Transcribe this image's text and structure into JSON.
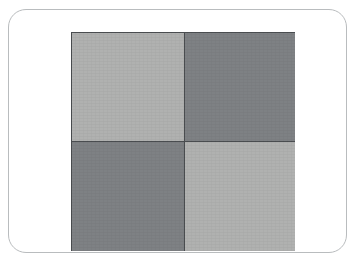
{
  "figure": {
    "title": "",
    "type": "checkerboard-swatch",
    "frame": {
      "name": "rounded-card-frame",
      "background_color": "#ffffff",
      "border_color": "#b9bcbe",
      "border_radius_px": 18,
      "x": 8,
      "y": 9,
      "width": 339,
      "height": 244
    },
    "board": {
      "x": 62,
      "y": 22,
      "width": 224,
      "height": 219,
      "rows": 2,
      "columns": 2,
      "divider_color": "#4a4d50",
      "divider_width_px": 1,
      "outline_color": "#4a4d50"
    },
    "palette": {
      "light_gray": "#b0b1b0",
      "dark_gray": "#7e8184",
      "divider": "#4a4d50",
      "frame_border": "#b9bcbe",
      "page_background": "#ffffff"
    },
    "quadrants": [
      {
        "position": "top-left",
        "shade": "light",
        "color": "#b0b1b0",
        "label": ""
      },
      {
        "position": "top-right",
        "shade": "dark",
        "color": "#7e8184",
        "label": ""
      },
      {
        "position": "bottom-left",
        "shade": "dark",
        "color": "#7e8184",
        "label": ""
      },
      {
        "position": "bottom-right",
        "shade": "light",
        "color": "#b0b1b0",
        "label": ""
      }
    ]
  }
}
